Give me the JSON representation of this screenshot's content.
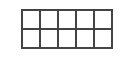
{
  "grid": {
    "rows": 2,
    "cols": 5,
    "cells": [
      [
        "",
        "",
        "",
        "",
        ""
      ],
      [
        "",
        "",
        "",
        "",
        ""
      ]
    ],
    "line_color": "#444444",
    "fill_color": "#ffffff"
  }
}
